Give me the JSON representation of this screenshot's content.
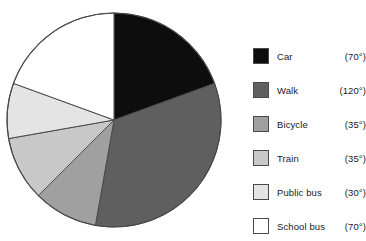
{
  "chart_data": {
    "type": "pie",
    "title": "",
    "subtitle": "",
    "xlabel": "",
    "ylabel": "",
    "units": "degrees",
    "start_angle_deg": 0,
    "direction": "clockwise",
    "outline_color": "#4a4a4a",
    "background": "#ffffff",
    "legend_position": "right",
    "categories": [
      "Car",
      "Walk",
      "Bicycle",
      "Train",
      "Public bus",
      "School bus"
    ],
    "values": [
      70,
      120,
      35,
      35,
      30,
      70
    ],
    "value_labels": [
      "(70°)",
      "(120°)",
      "(35°)",
      "(35°)",
      "(30°)",
      "(70°)"
    ],
    "colors": [
      "#0d0d0d",
      "#5f5f5f",
      "#a0a0a0",
      "#c8c8c8",
      "#e4e4e4",
      "#ffffff"
    ],
    "slices": [
      {
        "label": "Car",
        "degrees": 70,
        "value_label": "(70°)",
        "color": "#0d0d0d",
        "start_deg": 0,
        "end_deg": 70
      },
      {
        "label": "Walk",
        "degrees": 120,
        "value_label": "(120°)",
        "color": "#5f5f5f",
        "start_deg": 70,
        "end_deg": 190
      },
      {
        "label": "Bicycle",
        "degrees": 35,
        "value_label": "(35°)",
        "color": "#a0a0a0",
        "start_deg": 190,
        "end_deg": 225
      },
      {
        "label": "Train",
        "degrees": 35,
        "value_label": "(35°)",
        "color": "#c8c8c8",
        "start_deg": 225,
        "end_deg": 260
      },
      {
        "label": "Public bus",
        "degrees": 30,
        "value_label": "(30°)",
        "color": "#e4e4e4",
        "start_deg": 260,
        "end_deg": 290
      },
      {
        "label": "School bus",
        "degrees": 70,
        "value_label": "(70°)",
        "color": "#ffffff",
        "start_deg": 290,
        "end_deg": 360
      }
    ]
  },
  "legend": {
    "rows": [
      {
        "label": "Car",
        "value": "(70°)",
        "color": "#0d0d0d"
      },
      {
        "label": "Walk",
        "value": "(120°)",
        "color": "#5f5f5f"
      },
      {
        "label": "Bicycle",
        "value": "(35°)",
        "color": "#a0a0a0"
      },
      {
        "label": "Train",
        "value": "(35°)",
        "color": "#c8c8c8"
      },
      {
        "label": "Public bus",
        "value": "(30°)",
        "color": "#e4e4e4"
      },
      {
        "label": "School bus",
        "value": "(70°)",
        "color": "#ffffff"
      }
    ]
  },
  "geometry": {
    "center_x": 114,
    "center_y": 120,
    "radius": 107,
    "legend_row_spacing": 34,
    "legend_first_row_y": 8
  }
}
